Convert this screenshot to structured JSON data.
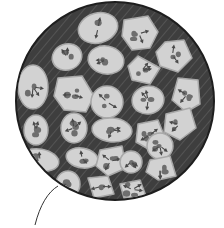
{
  "figure": {
    "type": "cell-section-illustration",
    "background_color": "#ffffff",
    "disc": {
      "cx": 115,
      "cy": 101,
      "r": 99,
      "fill": "#3e3e3e",
      "rim": "#1e1e1e",
      "hatch_color": "#5a5a5a"
    },
    "blob_fill": "#d2d2d2",
    "blob_edge": "#a8a8a8",
    "spot_color": "#6e6e6e",
    "arrow_color": "#4a4a4a",
    "blobs": [
      {
        "shape": "ellipse",
        "cx": 98,
        "cy": 28,
        "rx": 20,
        "ry": 15,
        "rot": -15
      },
      {
        "shape": "poly",
        "points": "124,20 148,16 158,32 150,48 132,50 122,36"
      },
      {
        "shape": "poly",
        "points": "165,42 184,40 192,58 178,72 160,66 156,52"
      },
      {
        "shape": "ellipse",
        "cx": 67,
        "cy": 57,
        "rx": 15,
        "ry": 13,
        "rot": -20
      },
      {
        "shape": "ellipse",
        "cx": 106,
        "cy": 60,
        "rx": 18,
        "ry": 14,
        "rot": 10
      },
      {
        "shape": "poly",
        "points": "138,56 160,68 150,84 132,80 128,66"
      },
      {
        "shape": "poly",
        "points": "178,78 198,80 200,104 186,112 172,100"
      },
      {
        "shape": "ellipse",
        "cx": 33,
        "cy": 87,
        "rx": 15,
        "ry": 22,
        "rot": 0
      },
      {
        "shape": "poly",
        "points": "58,78 82,76 94,96 86,112 64,110 54,96"
      },
      {
        "shape": "circle",
        "cx": 107,
        "cy": 102,
        "r": 16
      },
      {
        "shape": "ellipse",
        "cx": 148,
        "cy": 100,
        "rx": 16,
        "ry": 14,
        "rot": -10
      },
      {
        "shape": "poly",
        "points": "166,114 190,108 196,128 180,140 164,132"
      },
      {
        "shape": "ellipse",
        "cx": 36,
        "cy": 130,
        "rx": 12,
        "ry": 15,
        "rot": 0
      },
      {
        "shape": "ellipse",
        "cx": 74,
        "cy": 128,
        "rx": 13,
        "ry": 15,
        "rot": 0
      },
      {
        "shape": "ellipse",
        "cx": 112,
        "cy": 130,
        "rx": 20,
        "ry": 12,
        "rot": 5
      },
      {
        "shape": "poly",
        "points": "138,124 158,120 166,140 150,150 136,142"
      },
      {
        "shape": "circle",
        "cx": 160,
        "cy": 146,
        "r": 13
      },
      {
        "shape": "ellipse",
        "cx": 40,
        "cy": 160,
        "rx": 19,
        "ry": 11,
        "rot": 10
      },
      {
        "shape": "ellipse",
        "cx": 82,
        "cy": 158,
        "rx": 16,
        "ry": 10,
        "rot": 10
      },
      {
        "shape": "poly",
        "points": "100,150 122,146 126,168 108,176 96,166"
      },
      {
        "shape": "circle",
        "cx": 131,
        "cy": 162,
        "r": 11
      },
      {
        "shape": "poly",
        "points": "150,160 170,156 176,176 158,180 146,172"
      },
      {
        "shape": "ellipse",
        "cx": 68,
        "cy": 184,
        "rx": 12,
        "ry": 13,
        "rot": 0
      },
      {
        "shape": "poly",
        "points": "88,178 108,176 114,194 94,198"
      },
      {
        "shape": "poly",
        "points": "120,184 140,180 146,196 124,198"
      }
    ],
    "leader_line": {
      "path": "M35,225 C40,205 48,192 58,186",
      "color": "#333333"
    },
    "caption": ""
  }
}
